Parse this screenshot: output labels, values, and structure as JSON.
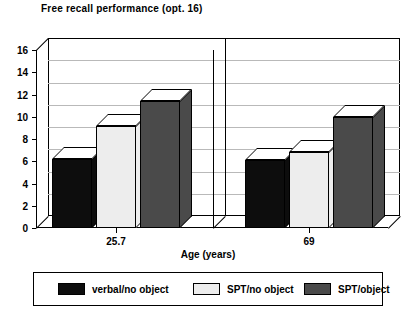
{
  "chart_data": {
    "type": "bar",
    "title": "Free recall performance (opt. 16)",
    "xlabel": "Age (years)",
    "ylabel": "",
    "categories": [
      "25.7",
      "69"
    ],
    "ylim": [
      0,
      16
    ],
    "ytick_step": 2,
    "yticks": [
      "0",
      "2",
      "4",
      "6",
      "8",
      "10",
      "12",
      "14",
      "16"
    ],
    "grid": true,
    "legend_position": "bottom",
    "style": "3d-bar",
    "series": [
      {
        "name": "verbal/no object",
        "color": "#0d0d0d",
        "values": [
          6.2,
          6.1
        ]
      },
      {
        "name": "SPT/no object",
        "color": "#ededed",
        "values": [
          9.2,
          6.8
        ]
      },
      {
        "name": "SPT/object",
        "color": "#4a4a4a",
        "values": [
          11.4,
          10.0
        ]
      }
    ]
  },
  "legend": {
    "items": [
      {
        "label": "verbal/no object",
        "swatch": "legend-swatch-verbal-no-object"
      },
      {
        "label": "SPT/no object",
        "swatch": "legend-swatch-spt-no-object"
      },
      {
        "label": "SPT/object",
        "swatch": "legend-swatch-spt-object"
      }
    ]
  }
}
